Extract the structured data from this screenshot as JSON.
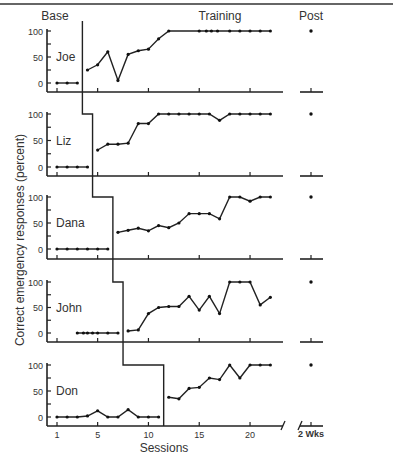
{
  "chart_data": {
    "type": "line",
    "layout": "multiple-baseline (5 stacked panels)",
    "phases": [
      "Base",
      "Training",
      "Post"
    ],
    "ylabel": "Correct emergency responses (percent)",
    "xlabel": "Sessions",
    "x_ticks": [
      "1",
      "5",
      "10",
      "15",
      "20"
    ],
    "post_tick_label": "2 Wks",
    "y_ticks": [
      "0",
      "50",
      "100"
    ],
    "ylim": [
      0,
      100
    ],
    "series": [
      {
        "name": "Joe",
        "baseline": {
          "x": [
            1,
            2,
            3
          ],
          "y": [
            0,
            0,
            0
          ]
        },
        "phase_change_after": 3.5,
        "training": {
          "x": [
            4,
            5,
            6,
            7,
            8,
            9,
            10,
            11,
            12,
            15,
            15.7,
            16.2,
            16.8,
            18,
            19,
            20,
            21,
            22
          ],
          "y": [
            25,
            35,
            60,
            5,
            55,
            62,
            65,
            85,
            100,
            100,
            100,
            100,
            100,
            100,
            100,
            100,
            100,
            100
          ]
        },
        "post": 100
      },
      {
        "name": "Liz",
        "baseline": {
          "x": [
            1,
            2,
            3,
            4
          ],
          "y": [
            0,
            0,
            0,
            0
          ]
        },
        "phase_change_after": 4.5,
        "training": {
          "x": [
            5,
            6,
            7,
            8,
            9,
            10,
            11,
            12,
            13,
            14,
            15,
            16,
            17,
            18,
            19,
            20,
            21,
            22
          ],
          "y": [
            32,
            43,
            43,
            45,
            82,
            82,
            100,
            100,
            100,
            100,
            100,
            100,
            88,
            100,
            100,
            100,
            100,
            100
          ]
        },
        "post": 100
      },
      {
        "name": "Dana",
        "baseline": {
          "x": [
            1,
            2,
            3,
            4,
            5,
            6
          ],
          "y": [
            0,
            0,
            0,
            0,
            0,
            0
          ]
        },
        "phase_change_after": 6.5,
        "training": {
          "x": [
            7,
            8,
            9,
            10,
            11,
            12,
            13,
            14,
            15,
            16,
            17,
            18,
            19,
            20,
            21,
            22
          ],
          "y": [
            32,
            36,
            40,
            35,
            45,
            41,
            50,
            68,
            68,
            68,
            58,
            100,
            100,
            92,
            100,
            100
          ]
        },
        "post": 100
      },
      {
        "name": "John",
        "baseline": {
          "x": [
            3,
            3.6,
            4,
            4.5,
            5,
            6,
            7
          ],
          "y": [
            0,
            0,
            0,
            0,
            0,
            0,
            0
          ]
        },
        "phase_change_after": 7.5,
        "training": {
          "x": [
            8,
            9,
            10,
            11,
            12,
            13,
            14,
            15,
            16,
            17,
            18,
            19,
            20,
            21,
            22
          ],
          "y": [
            4,
            6,
            38,
            50,
            52,
            52,
            72,
            45,
            72,
            38,
            100,
            100,
            100,
            55,
            70
          ]
        },
        "post": 100
      },
      {
        "name": "Don",
        "baseline": {
          "x": [
            1,
            2,
            3,
            4,
            5,
            6,
            7,
            8,
            9,
            10,
            11
          ],
          "y": [
            0,
            0,
            0,
            2,
            12,
            0,
            0,
            14,
            0,
            0,
            0
          ]
        },
        "phase_change_after": 11.5,
        "training": {
          "x": [
            12,
            13,
            14,
            15,
            16,
            17,
            18,
            19,
            20,
            21,
            22
          ],
          "y": [
            38,
            35,
            55,
            57,
            75,
            72,
            100,
            75,
            100,
            100,
            100
          ]
        },
        "post": 100
      }
    ]
  }
}
